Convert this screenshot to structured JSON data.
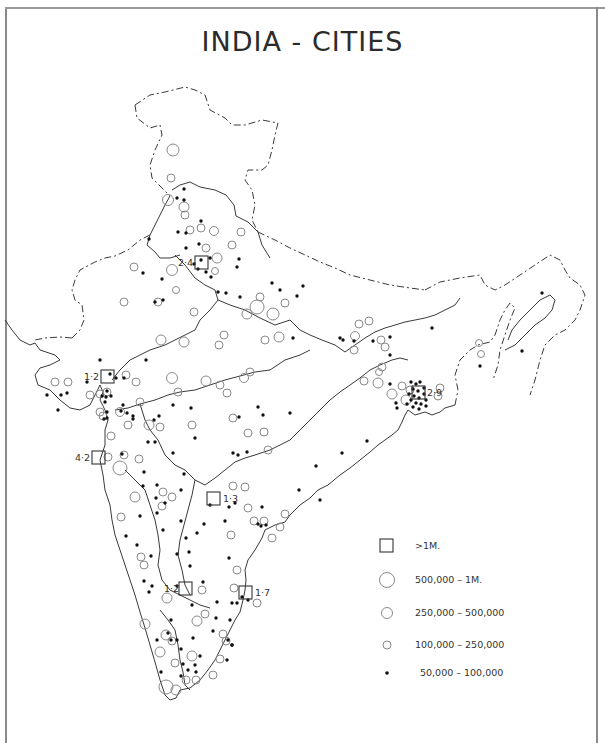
{
  "title": "INDIA - CITIES",
  "legend": [
    {
      "symbol": "square",
      "label": ">1M."
    },
    {
      "symbol": "circle-large",
      "label": "500,000 – 1M."
    },
    {
      "symbol": "circle-medium",
      "label": "250,000 – 500,000"
    },
    {
      "symbol": "circle-small",
      "label": "100,000 – 250,000"
    },
    {
      "symbol": "dot",
      "label": "50,000 – 100,000"
    }
  ],
  "million_cities": [
    {
      "label": "2·4",
      "x": 201,
      "y": 262
    },
    {
      "label": "1·2",
      "x": 107,
      "y": 377
    },
    {
      "label": "4·2",
      "x": 98,
      "y": 458
    },
    {
      "label": "2·9",
      "x": 421,
      "y": 398
    },
    {
      "label": "1·3",
      "x": 214,
      "y": 499
    },
    {
      "label": "1·2",
      "x": 186,
      "y": 589
    },
    {
      "label": "1·7",
      "x": 246,
      "y": 593
    }
  ],
  "colors": {
    "line": "#3a3a3a",
    "circle": "#8a8a8a",
    "dot": "#111111",
    "text": "#2b2b2b"
  }
}
